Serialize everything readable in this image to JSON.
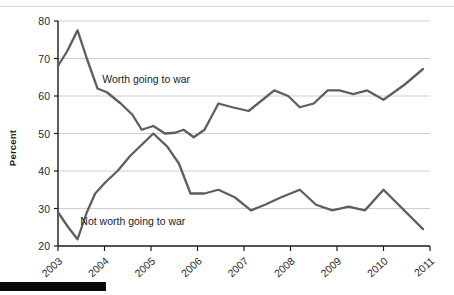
{
  "chart_data": {
    "type": "line",
    "title": "",
    "subtitle": "",
    "xlabel": "",
    "ylabel": "Percent",
    "ylim": [
      20,
      80
    ],
    "ytick_step": 10,
    "yticks": [
      "20",
      "30",
      "40",
      "50",
      "60",
      "70",
      "80"
    ],
    "xlim": [
      2003,
      2011
    ],
    "xticks": [
      "2003",
      "2004",
      "2005",
      "2006",
      "2007",
      "2008",
      "2009",
      "2010",
      "2011"
    ],
    "grid": "horizontal",
    "legend_position": "inline-annotation",
    "line_color": "#5e5e5e",
    "grid_color": "#cfcfcf",
    "axis_color": "#1a1a1a",
    "series": [
      {
        "name": "Worth going to war",
        "annotation": "Worth going to war",
        "annotation_x": 2003.95,
        "annotation_y": 63.5,
        "points": [
          {
            "x": 2003.0,
            "y": 68
          },
          {
            "x": 2003.2,
            "y": 72
          },
          {
            "x": 2003.42,
            "y": 77.5
          },
          {
            "x": 2003.62,
            "y": 70
          },
          {
            "x": 2003.85,
            "y": 62
          },
          {
            "x": 2004.05,
            "y": 61
          },
          {
            "x": 2004.35,
            "y": 58
          },
          {
            "x": 2004.6,
            "y": 55
          },
          {
            "x": 2004.8,
            "y": 51
          },
          {
            "x": 2005.05,
            "y": 52
          },
          {
            "x": 2005.3,
            "y": 50
          },
          {
            "x": 2005.52,
            "y": 50.2
          },
          {
            "x": 2005.7,
            "y": 51
          },
          {
            "x": 2005.92,
            "y": 49
          },
          {
            "x": 2006.15,
            "y": 51
          },
          {
            "x": 2006.45,
            "y": 58
          },
          {
            "x": 2006.75,
            "y": 57
          },
          {
            "x": 2007.1,
            "y": 56
          },
          {
            "x": 2007.4,
            "y": 59
          },
          {
            "x": 2007.65,
            "y": 61.5
          },
          {
            "x": 2007.95,
            "y": 60
          },
          {
            "x": 2008.2,
            "y": 57
          },
          {
            "x": 2008.5,
            "y": 58
          },
          {
            "x": 2008.8,
            "y": 61.5
          },
          {
            "x": 2009.05,
            "y": 61.5
          },
          {
            "x": 2009.35,
            "y": 60.5
          },
          {
            "x": 2009.65,
            "y": 61.5
          },
          {
            "x": 2010.0,
            "y": 59
          },
          {
            "x": 2010.45,
            "y": 63
          },
          {
            "x": 2010.85,
            "y": 67.2
          }
        ]
      },
      {
        "name": "Not worth going to war",
        "annotation": "Not worth going to war",
        "annotation_x": 2003.48,
        "annotation_y": 25.5,
        "points": [
          {
            "x": 2003.0,
            "y": 29
          },
          {
            "x": 2003.22,
            "y": 25
          },
          {
            "x": 2003.42,
            "y": 21.8
          },
          {
            "x": 2003.62,
            "y": 29
          },
          {
            "x": 2003.8,
            "y": 34
          },
          {
            "x": 2004.02,
            "y": 37
          },
          {
            "x": 2004.28,
            "y": 40
          },
          {
            "x": 2004.55,
            "y": 44
          },
          {
            "x": 2004.8,
            "y": 47
          },
          {
            "x": 2005.05,
            "y": 50
          },
          {
            "x": 2005.35,
            "y": 46.5
          },
          {
            "x": 2005.6,
            "y": 42
          },
          {
            "x": 2005.85,
            "y": 34
          },
          {
            "x": 2006.15,
            "y": 34
          },
          {
            "x": 2006.45,
            "y": 35
          },
          {
            "x": 2006.8,
            "y": 33
          },
          {
            "x": 2007.15,
            "y": 29.5
          },
          {
            "x": 2007.45,
            "y": 31
          },
          {
            "x": 2007.8,
            "y": 33
          },
          {
            "x": 2008.2,
            "y": 35
          },
          {
            "x": 2008.55,
            "y": 31
          },
          {
            "x": 2008.9,
            "y": 29.5
          },
          {
            "x": 2009.25,
            "y": 30.5
          },
          {
            "x": 2009.6,
            "y": 29.5
          },
          {
            "x": 2010.0,
            "y": 35
          },
          {
            "x": 2010.85,
            "y": 24.5
          }
        ]
      }
    ]
  }
}
